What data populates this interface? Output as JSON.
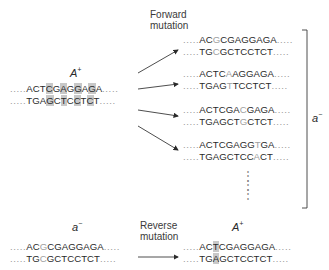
{
  "forward": {
    "label_line1": "Forward",
    "label_line2": "mutation"
  },
  "reverse": {
    "label_line1": "Reverse",
    "label_line2": "mutation"
  },
  "wildtype": {
    "genotype_main": "A",
    "genotype_sup": "+",
    "top": "ACTCGAGGAGA",
    "bottom": "TGAGCTCCTCT",
    "highlighted_positions": [
      3,
      5,
      7,
      9
    ]
  },
  "mutants": [
    {
      "top": "ACGCGAGGAGA",
      "bottom": "TGCGCTCCTCT",
      "mutated_position": 2
    },
    {
      "top": "ACTCAAGGAGA",
      "bottom": "TGAGTTCCTCT",
      "mutated_position": 4
    },
    {
      "top": "ACTCGACGAGA",
      "bottom": "TGAGCTGCTCT",
      "mutated_position": 6
    },
    {
      "top": "ACTCGAGGTGA",
      "bottom": "TGAGCTCCACT",
      "mutated_position": 8
    }
  ],
  "bracket": {
    "genotype_main": "a",
    "genotype_sup": "−"
  },
  "reverse_from": {
    "genotype_main": "a",
    "genotype_sup": "−",
    "top": "ACGCGAGGAGA",
    "bottom": "TGCGCTCCTCT",
    "mutated_position": 2
  },
  "reverse_to": {
    "genotype_main": "A",
    "genotype_sup": "+",
    "top": "ACTCGAGGAGA",
    "bottom": "TGAGCTCCTCT",
    "highlighted_position": 2
  },
  "dots": ".....",
  "vertical_ellipsis": "⋮"
}
